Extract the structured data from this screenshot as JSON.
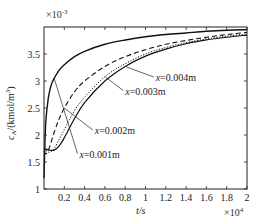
{
  "chart_data": {
    "type": "line",
    "title": "",
    "xlabel": "t/s",
    "xlabel_multiplier": "×10^4",
    "ylabel": "c_A/(kmol/m^3)",
    "ylabel_multiplier": "×10^-3",
    "xlim": [
      0,
      2
    ],
    "ylim": [
      1,
      4
    ],
    "xticks": [
      0.2,
      0.4,
      0.6,
      0.8,
      1,
      1.2,
      1.4,
      1.6,
      1.8,
      2
    ],
    "xtick_labels": [
      "0.2",
      "0.4",
      "0.6",
      "0.8",
      "1",
      "1.2",
      "1.4",
      "1.6",
      "1.8",
      "2"
    ],
    "yticks": [
      1,
      1.5,
      2,
      2.5,
      3,
      3.5
    ],
    "ytick_labels": [
      "1",
      "1.5",
      "2",
      "2.5",
      "3",
      "3.5"
    ],
    "grid": false,
    "legend": "annotations",
    "series": [
      {
        "name": "x=0.001m",
        "style": "solid-thick",
        "x": [
          0,
          0.01,
          0.02,
          0.04,
          0.06,
          0.08,
          0.1,
          0.15,
          0.2,
          0.3,
          0.4,
          0.6,
          0.8,
          1.0,
          1.2,
          1.4,
          1.6,
          1.8,
          2.0
        ],
        "y": [
          1.2,
          1.9,
          2.3,
          2.65,
          2.85,
          2.97,
          3.05,
          3.2,
          3.3,
          3.45,
          3.55,
          3.68,
          3.76,
          3.82,
          3.86,
          3.89,
          3.92,
          3.94,
          3.95
        ]
      },
      {
        "name": "x=0.002m",
        "style": "dashed",
        "x": [
          0,
          0.02,
          0.05,
          0.1,
          0.15,
          0.2,
          0.3,
          0.4,
          0.6,
          0.8,
          1.0,
          1.2,
          1.4,
          1.6,
          1.8,
          2.0
        ],
        "y": [
          1.7,
          1.65,
          1.75,
          2.05,
          2.3,
          2.5,
          2.8,
          3.0,
          3.27,
          3.45,
          3.58,
          3.68,
          3.75,
          3.81,
          3.86,
          3.9
        ]
      },
      {
        "name": "x=0.003m",
        "style": "dotted",
        "x": [
          0,
          0.05,
          0.1,
          0.15,
          0.2,
          0.3,
          0.4,
          0.6,
          0.8,
          1.0,
          1.2,
          1.4,
          1.6,
          1.8,
          2.0
        ],
        "y": [
          1.75,
          1.68,
          1.75,
          1.92,
          2.1,
          2.45,
          2.7,
          3.08,
          3.32,
          3.5,
          3.62,
          3.71,
          3.78,
          3.83,
          3.87
        ]
      },
      {
        "name": "x=0.004m",
        "style": "dash-dot",
        "x": [
          0,
          0.05,
          0.1,
          0.15,
          0.2,
          0.3,
          0.4,
          0.6,
          0.8,
          1.0,
          1.2,
          1.4,
          1.6,
          1.8,
          2.0
        ],
        "y": [
          1.75,
          1.72,
          1.72,
          1.8,
          1.95,
          2.3,
          2.6,
          3.0,
          3.27,
          3.46,
          3.59,
          3.69,
          3.76,
          3.81,
          3.85
        ]
      }
    ],
    "annotations": [
      {
        "text": "x=0.004m",
        "label_at": [
          1.1,
          3.0
        ],
        "points_to_series": "x=0.004m"
      },
      {
        "text": "x=0.003m",
        "label_at": [
          0.8,
          2.75
        ],
        "points_to_series": "x=0.003m"
      },
      {
        "text": "x=0.002m",
        "label_at": [
          0.5,
          2.02
        ],
        "points_to_series": "x=0.002m"
      },
      {
        "text": "x=0.001m",
        "label_at": [
          0.35,
          1.58
        ],
        "points_to_series": "x=0.001m"
      }
    ]
  },
  "labels": {
    "x_axis": "t/s",
    "x_mult": "×10",
    "x_mult_exp": "4",
    "y_axis_main": "c",
    "y_axis_sub": "A",
    "y_axis_rest": "/(kmol/m",
    "y_axis_sup": "3",
    "y_axis_close": ")",
    "y_mult": "×10",
    "y_mult_exp": "-3"
  }
}
